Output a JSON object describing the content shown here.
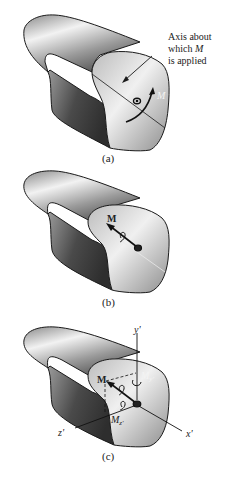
{
  "panels": [
    {
      "id": "a",
      "caption": "(a)",
      "annotation": {
        "line1": "Axis about",
        "line2_prefix": "which ",
        "line2_symbol": "M",
        "line3": "is applied"
      },
      "moment_label": "M"
    },
    {
      "id": "b",
      "caption": "(b)",
      "moment_label": "M"
    },
    {
      "id": "c",
      "caption": "(c)",
      "moment_label": "M",
      "component_y_label": "M",
      "component_y_sub": "y'",
      "component_z_label": "M",
      "component_z_sub": "z'",
      "axis_x_label": "x'",
      "axis_y_label": "y'",
      "axis_z_label": "z'"
    }
  ]
}
